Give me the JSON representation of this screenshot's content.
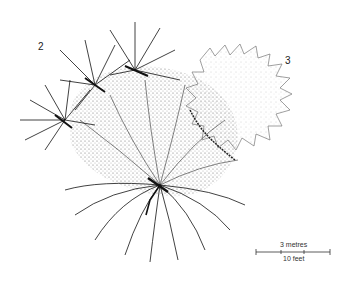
{
  "diagram": {
    "type": "botanical plan-view canopy illustration",
    "labels": [
      {
        "id": "2",
        "text": "2"
      },
      {
        "id": "3",
        "text": "3"
      }
    ],
    "scale_bar": {
      "top_label": "3 metres",
      "bottom_label": "10 feet"
    },
    "colors": {
      "ink": "#111111",
      "stipple": "#555555",
      "background": "#ffffff"
    }
  }
}
